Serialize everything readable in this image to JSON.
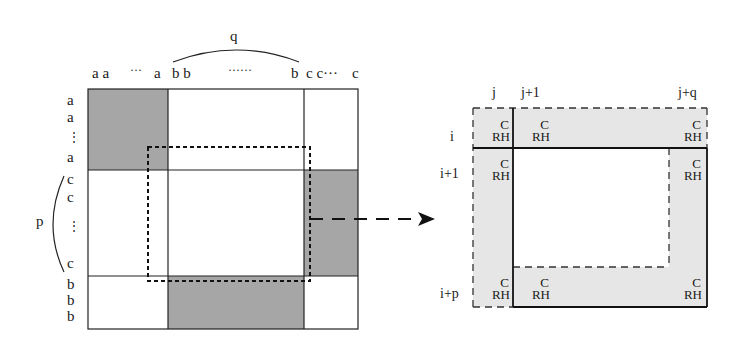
{
  "left_matrix": {
    "top_brace_label": "q",
    "side_brace_label": "p",
    "column_labels": [
      "a a",
      "···",
      "a",
      "b b",
      "······",
      "b",
      "c c···",
      "c"
    ],
    "row_labels": [
      "a",
      "a",
      "⋮",
      "a",
      "c",
      "c",
      "⋮",
      "c",
      "b",
      "b",
      "b"
    ],
    "shade_color": "#a6a6a6"
  },
  "right_matrix": {
    "column_labels": [
      "j",
      "j+1",
      "j+q"
    ],
    "row_labels": [
      "i",
      "i+1",
      "i+p"
    ],
    "cell_top": "C",
    "cell_bottom": "RH",
    "shade_color": "#e6e6e6"
  }
}
